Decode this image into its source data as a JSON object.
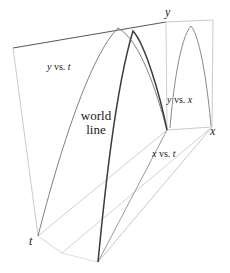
{
  "figure": {
    "type": "diagram",
    "background_color": "#ffffff",
    "axes": {
      "t": {
        "label": "t",
        "x": 30,
        "y": 236
      },
      "x": {
        "label": "x",
        "x": 210,
        "y": 126
      },
      "y": {
        "label": "y",
        "x": 165,
        "y": 8
      }
    },
    "labels": {
      "y_vs_t": {
        "italic_1": "y",
        "roman": " vs. ",
        "italic_2": "t",
        "x": 47,
        "y": 63
      },
      "y_vs_x": {
        "italic_1": "y",
        "roman": " vs. ",
        "italic_2": "x",
        "x": 167,
        "y": 96
      },
      "x_vs_t": {
        "italic_1": "x",
        "roman": " vs. ",
        "italic_2": "t",
        "x": 152,
        "y": 150
      },
      "world_line": {
        "line1": "world",
        "line2": "line",
        "x": 72,
        "y": 110
      }
    },
    "colors": {
      "world_line": "#3a3a3a",
      "projection_curve": "#6e6e6e",
      "frame_dark": "#555555",
      "frame_light": "#c9c9c9",
      "text": "#1a1a1a"
    },
    "geometry": {
      "note": "Oblique box: back/left face is the y-vs-t plane, bottom face is the x-vs-t plane, right face is the y-vs-x plane.",
      "box_vertices": {
        "back_top_left": [
          13,
          48
        ],
        "back_top_right": [
          166,
          22
        ],
        "back_bottom_left": [
          38,
          236
        ],
        "back_bottom_right": [
          167,
          130
        ],
        "front_top_right": [
          213,
          20
        ],
        "front_bottom_right": [
          212,
          127
        ],
        "front_bottom_left": [
          98,
          262
        ],
        "front_bottom_mid": [
          62,
          253
        ]
      },
      "curves": {
        "y_vs_t_peak": [
          118,
          28
        ],
        "world_line_peak": [
          133,
          31
        ],
        "y_vs_x_peak": [
          191,
          26
        ],
        "launch_point": [
          98,
          262
        ],
        "landing_point": [
          167,
          130
        ]
      }
    }
  }
}
